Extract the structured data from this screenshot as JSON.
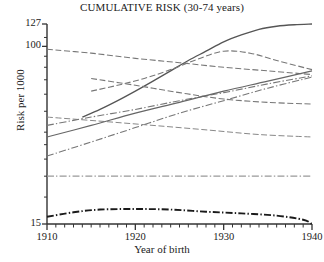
{
  "chart_data": {
    "type": "line",
    "title": "CUMULATIVE RISK (30-74 years)",
    "xlabel": "Year of birth",
    "ylabel": "Risk per 1000",
    "xlim": [
      1910,
      1940
    ],
    "ylim": [
      15,
      127
    ],
    "yscale": "log",
    "grid": false,
    "legend": "none",
    "x_ticks_major": [
      1910,
      1920,
      1930,
      1940
    ],
    "x_tick_labels": [
      "1910",
      "1920",
      "1930",
      "1940"
    ],
    "x_minor_tick_step": 1,
    "y_ticks_labeled": [
      15,
      100,
      127
    ],
    "y_tick_labels": [
      "15",
      "100",
      "127"
    ],
    "y_minor_ticks": [
      20,
      25,
      30,
      35,
      40,
      50,
      60,
      70,
      80,
      90,
      110
    ],
    "series": [
      {
        "name": "series-1-solid-rising-steep",
        "style": "solid",
        "color": "#555555",
        "width": 1.3,
        "x": [
          1914,
          1916,
          1918,
          1920,
          1922,
          1924,
          1926,
          1928,
          1930,
          1932,
          1934,
          1936,
          1938,
          1940
        ],
        "y": [
          47,
          51,
          56,
          62,
          69,
          77,
          86,
          95,
          105,
          113,
          120,
          124,
          126,
          127
        ]
      },
      {
        "name": "series-2-dashed-declining-top",
        "style": "dashed",
        "color": "#777777",
        "width": 1.1,
        "x": [
          1910,
          1915,
          1920,
          1925,
          1930,
          1935,
          1940
        ],
        "y": [
          97,
          93,
          88,
          84,
          80,
          77,
          74
        ]
      },
      {
        "name": "series-3-dashed-hump",
        "style": "dashed",
        "color": "#777777",
        "width": 1.1,
        "x": [
          1915,
          1918,
          1921,
          1924,
          1927,
          1930,
          1933,
          1936,
          1940
        ],
        "y": [
          62,
          66,
          71,
          78,
          87,
          95,
          93,
          86,
          78
        ]
      },
      {
        "name": "series-4-dashed-declining-mid",
        "style": "dashed",
        "color": "#777777",
        "width": 1.1,
        "x": [
          1915,
          1920,
          1925,
          1930,
          1935,
          1940
        ],
        "y": [
          71,
          66,
          61,
          57,
          55,
          54
        ]
      },
      {
        "name": "series-5-dashed-declining-low",
        "style": "dashed",
        "color": "#888888",
        "width": 1.0,
        "x": [
          1910,
          1916,
          1922,
          1928,
          1934,
          1940
        ],
        "y": [
          47,
          45,
          43,
          41,
          39,
          38
        ]
      },
      {
        "name": "series-6-dashdot-rising-upper",
        "style": "dashdot",
        "color": "#777777",
        "width": 1.1,
        "x": [
          1910,
          1915,
          1920,
          1925,
          1930,
          1935,
          1940
        ],
        "y": [
          43,
          47,
          51,
          56,
          61,
          67,
          73
        ]
      },
      {
        "name": "series-7-solid-rising-mid",
        "style": "solid",
        "color": "#666666",
        "width": 1.2,
        "x": [
          1910,
          1915,
          1920,
          1925,
          1930,
          1935,
          1940
        ],
        "y": [
          38,
          43,
          49,
          55,
          62,
          69,
          77
        ]
      },
      {
        "name": "series-8-dashdot-rising-lower",
        "style": "dashdot",
        "color": "#777777",
        "width": 1.1,
        "x": [
          1910,
          1915,
          1920,
          1925,
          1930,
          1935,
          1940
        ],
        "y": [
          31,
          36,
          42,
          49,
          56,
          64,
          72
        ]
      },
      {
        "name": "series-9-dashdot-flat",
        "style": "dashdot",
        "color": "#999999",
        "width": 1.1,
        "x": [
          1910,
          1920,
          1930,
          1940
        ],
        "y": [
          25,
          25,
          25,
          25
        ]
      },
      {
        "name": "series-10-dashdot-bold-flat-low",
        "style": "dashdot",
        "color": "#1a1a1a",
        "width": 1.9,
        "x": [
          1910,
          1913,
          1916,
          1920,
          1924,
          1928,
          1932,
          1936,
          1939,
          1940
        ],
        "y": [
          16.2,
          17.0,
          17.5,
          17.6,
          17.5,
          17.1,
          16.8,
          16.4,
          15.7,
          15.0
        ]
      }
    ]
  }
}
